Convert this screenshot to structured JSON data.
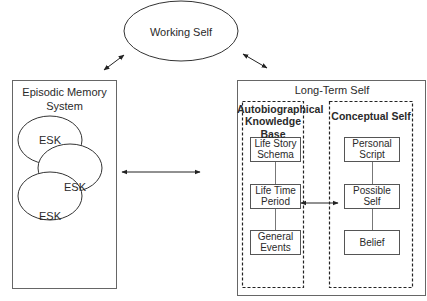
{
  "diagram": {
    "working_self": {
      "label": "Working Self"
    },
    "episodic_memory": {
      "title_line1": "Episodic Memory",
      "title_line2": "System",
      "items": [
        "ESK",
        "ESK",
        "ESK"
      ]
    },
    "long_term_self": {
      "title": "Long-Term Self",
      "autobiographical": {
        "title_line1": "Autobiographical",
        "title_line2": "Knowledge Base",
        "items": [
          {
            "line1": "Life Story",
            "line2": "Schema"
          },
          {
            "line1": "Life Time",
            "line2": "Period"
          },
          {
            "line1": "General",
            "line2": "Events"
          }
        ]
      },
      "conceptual": {
        "title": "Conceptual Self",
        "items": [
          {
            "line1": "Personal",
            "line2": "Script"
          },
          {
            "line1": "Possible",
            "line2": "Self"
          },
          {
            "line1": "Belief",
            "line2": ""
          }
        ]
      }
    },
    "connections": [
      "Working Self <-> Episodic Memory System",
      "Working Self <-> Long-Term Self",
      "Episodic Memory System <-> Long-Term Self",
      "Autobiographical Knowledge Base <-> Conceptual Self"
    ]
  }
}
